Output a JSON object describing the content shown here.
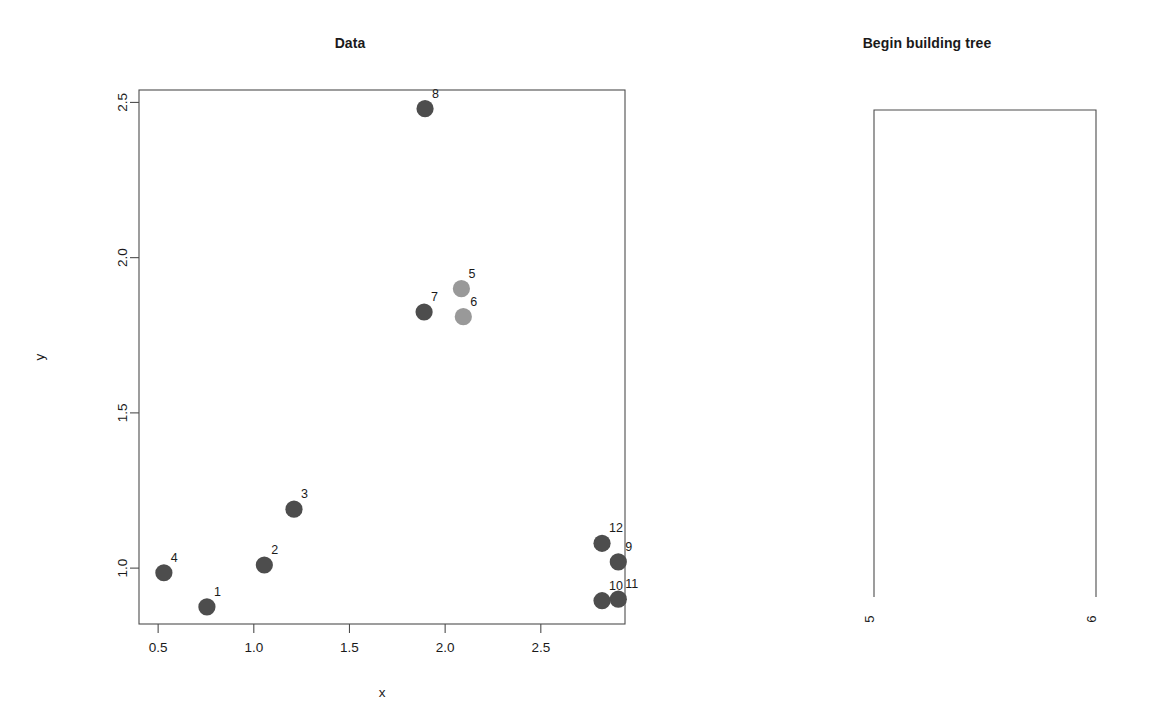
{
  "scatter_panel": {
    "title": "Data",
    "xlabel": "x",
    "ylabel": "y"
  },
  "tree_panel": {
    "title": "Begin building tree",
    "leaves": [
      {
        "label": "5"
      },
      {
        "label": "6"
      }
    ]
  },
  "chart_data": [
    {
      "type": "scatter",
      "title": "Data",
      "xlabel": "x",
      "ylabel": "y",
      "xlim": [
        0.4,
        2.94
      ],
      "ylim": [
        0.82,
        2.54
      ],
      "xticks": [
        0.5,
        1.0,
        1.5,
        2.0,
        2.5
      ],
      "xtick_labels": [
        "0.5",
        "1.0",
        "1.5",
        "2.0",
        "2.5"
      ],
      "yticks": [
        1.0,
        1.5,
        2.0,
        2.5
      ],
      "ytick_labels": [
        "1.0",
        "1.5",
        "2.0",
        "2.5"
      ],
      "grid": false,
      "legend": false,
      "point_colors": {
        "dark": "#4d4d4d",
        "light": "#999999"
      },
      "points": [
        {
          "label": "1",
          "x": 0.755,
          "y": 0.875,
          "color": "dark"
        },
        {
          "label": "2",
          "x": 1.055,
          "y": 1.01,
          "color": "dark"
        },
        {
          "label": "3",
          "x": 1.21,
          "y": 1.19,
          "color": "dark"
        },
        {
          "label": "4",
          "x": 0.53,
          "y": 0.985,
          "color": "dark"
        },
        {
          "label": "5",
          "x": 2.085,
          "y": 1.9,
          "color": "light"
        },
        {
          "label": "6",
          "x": 2.095,
          "y": 1.81,
          "color": "light"
        },
        {
          "label": "7",
          "x": 1.89,
          "y": 1.825,
          "color": "dark"
        },
        {
          "label": "8",
          "x": 1.895,
          "y": 2.48,
          "color": "dark"
        },
        {
          "label": "9",
          "x": 2.905,
          "y": 1.02,
          "color": "dark"
        },
        {
          "label": "10",
          "x": 2.82,
          "y": 0.895,
          "color": "dark"
        },
        {
          "label": "11",
          "x": 2.905,
          "y": 0.9,
          "color": "dark"
        },
        {
          "label": "12",
          "x": 2.82,
          "y": 1.08,
          "color": "dark"
        }
      ]
    },
    {
      "type": "dendrogram",
      "title": "Begin building tree",
      "leaves": [
        "5",
        "6"
      ],
      "merge_height": 1,
      "leaf_heights": [
        0,
        0
      ]
    }
  ]
}
